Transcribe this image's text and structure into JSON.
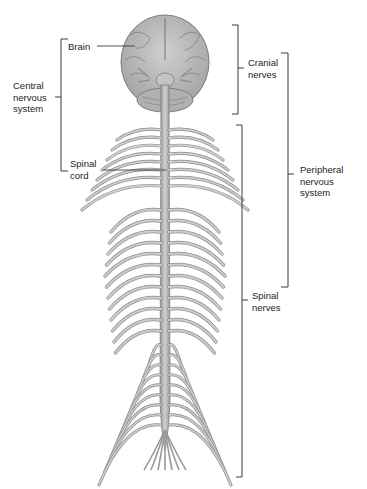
{
  "figure": {
    "corner_text": "",
    "colors": {
      "tissue_fill": "#b9b9b9",
      "tissue_dark": "#8a8a8a",
      "tissue_light": "#d6d6d6",
      "bracket": "#3a3a3a",
      "text": "#1e1e1e"
    }
  },
  "labels": {
    "brain": "Brain",
    "spinal_cord_1": "Spinal",
    "spinal_cord_2": "cord",
    "cns_1": "Central",
    "cns_2": "nervous",
    "cns_3": "system",
    "cranial_1": "Cranial",
    "cranial_2": "nerves",
    "pns_1": "Peripheral",
    "pns_2": "nervous",
    "pns_3": "system",
    "spinal_nerves_1": "Spinal",
    "spinal_nerves_2": "nerves"
  },
  "brackets": [
    {
      "name": "central-nervous-system",
      "side": "left",
      "top": 39,
      "bottom": 171
    },
    {
      "name": "cranial-nerves",
      "side": "right",
      "top": 25,
      "bottom": 114
    },
    {
      "name": "peripheral-nervous-system",
      "side": "right",
      "top": 53,
      "bottom": 287
    },
    {
      "name": "spinal-nerves",
      "side": "right",
      "top": 125,
      "bottom": 477
    }
  ]
}
